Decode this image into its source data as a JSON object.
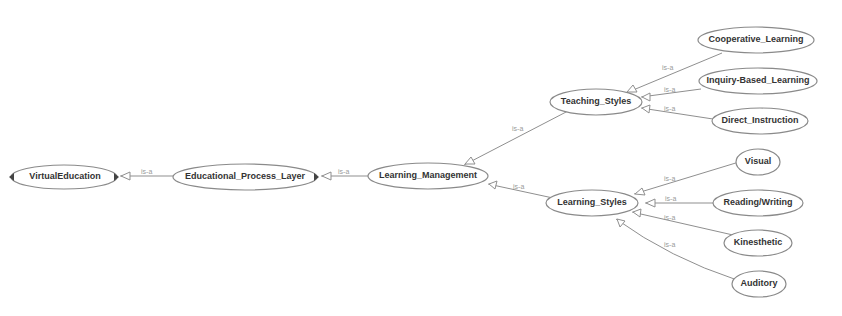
{
  "diagram": {
    "type": "ontology-graph",
    "relation_label": "is-a",
    "nodes": [
      {
        "id": "virtual_education",
        "label": "VirtualEducation"
      },
      {
        "id": "educational_process_layer",
        "label": "Educational_Process_Layer"
      },
      {
        "id": "learning_management",
        "label": "Learning_Management"
      },
      {
        "id": "teaching_styles",
        "label": "Teaching_Styles"
      },
      {
        "id": "learning_styles",
        "label": "Learning_Styles"
      },
      {
        "id": "cooperative_learning",
        "label": "Cooperative_Learning"
      },
      {
        "id": "inquiry_based_learning",
        "label": "Inquiry-Based_Learning"
      },
      {
        "id": "direct_instruction",
        "label": "Direct_Instruction"
      },
      {
        "id": "visual",
        "label": "Visual"
      },
      {
        "id": "reading_writing",
        "label": "Reading/Writing"
      },
      {
        "id": "kinesthetic",
        "label": "Kinesthetic"
      },
      {
        "id": "auditory",
        "label": "Auditory"
      }
    ],
    "edges": [
      {
        "from": "educational_process_layer",
        "to": "virtual_education",
        "label": "is-a"
      },
      {
        "from": "learning_management",
        "to": "educational_process_layer",
        "label": "is-a"
      },
      {
        "from": "teaching_styles",
        "to": "learning_management",
        "label": "is-a"
      },
      {
        "from": "learning_styles",
        "to": "learning_management",
        "label": "is-a"
      },
      {
        "from": "cooperative_learning",
        "to": "teaching_styles",
        "label": "is-a"
      },
      {
        "from": "inquiry_based_learning",
        "to": "teaching_styles",
        "label": "is-a"
      },
      {
        "from": "direct_instruction",
        "to": "teaching_styles",
        "label": "is-a"
      },
      {
        "from": "visual",
        "to": "learning_styles",
        "label": "is-a"
      },
      {
        "from": "reading_writing",
        "to": "learning_styles",
        "label": "is-a"
      },
      {
        "from": "kinesthetic",
        "to": "learning_styles",
        "label": "is-a"
      },
      {
        "from": "auditory",
        "to": "learning_styles",
        "label": "is-a"
      }
    ]
  }
}
